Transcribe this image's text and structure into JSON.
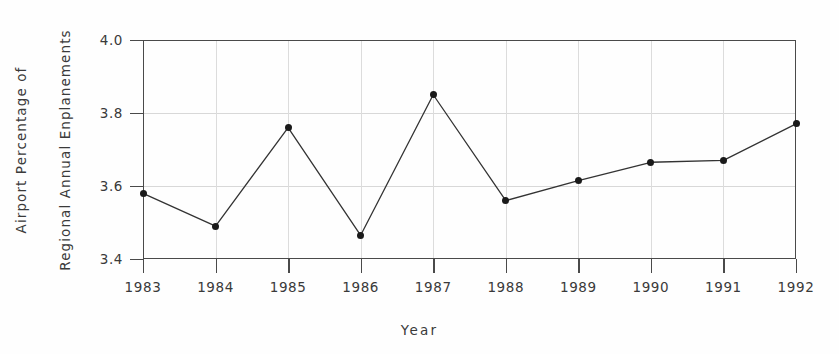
{
  "chart_data": {
    "type": "line",
    "title": "",
    "xlabel": "Year",
    "ylabel": "Airport Percentage of Regional Annual Enplanements",
    "ylabel_lines": [
      "Airport Percentage of",
      "Regional Annual Enplanements"
    ],
    "categories": [
      "1983",
      "1984",
      "1985",
      "1986",
      "1987",
      "1988",
      "1989",
      "1990",
      "1991",
      "1992"
    ],
    "x": [
      1983,
      1984,
      1985,
      1986,
      1987,
      1988,
      1989,
      1990,
      1991,
      1992
    ],
    "values": [
      3.58,
      3.49,
      3.76,
      3.465,
      3.85,
      3.56,
      3.615,
      3.665,
      3.67,
      3.77
    ],
    "series": [
      {
        "name": "Airport Percentage of Regional Annual Enplanements",
        "values": [
          3.58,
          3.49,
          3.76,
          3.465,
          3.85,
          3.56,
          3.615,
          3.665,
          3.67,
          3.77
        ]
      }
    ],
    "ylim": [
      3.4,
      4.0
    ],
    "xlim": [
      1983,
      1992
    ],
    "yticks": [
      3.4,
      3.6,
      3.8,
      4.0
    ],
    "ytick_labels": [
      "3.4",
      "3.6",
      "3.8",
      "4.0"
    ],
    "xtick_labels": [
      "1983",
      "1984",
      "1985",
      "1986",
      "1987",
      "1988",
      "1989",
      "1990",
      "1991",
      "1992"
    ],
    "grid": true,
    "legend": false,
    "marker": "filled-circle",
    "line_color": "#333333",
    "marker_color": "#1a1a1a",
    "grid_color": "#d8d8d8",
    "frame_color": "#4a4a4a",
    "background_color": "#fefefe"
  }
}
